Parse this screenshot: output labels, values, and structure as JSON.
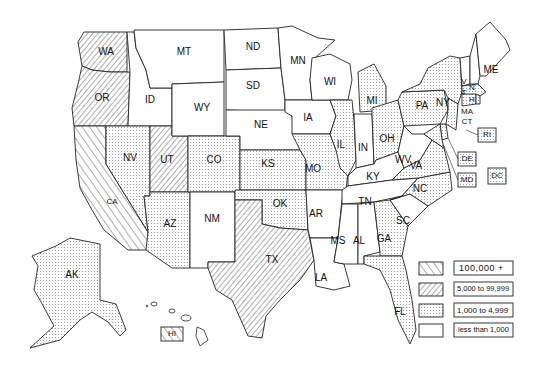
{
  "title": "",
  "legend": {
    "items": [
      {
        "key": "A",
        "label": "100,000 +",
        "pattern": "backslash-hatch"
      },
      {
        "key": "B",
        "label": "5,000 to 99,999",
        "pattern": "slash-hatch"
      },
      {
        "key": "C",
        "label": "1,000 to 4,999",
        "pattern": "dots"
      },
      {
        "key": "D",
        "label": "less than 1,000",
        "pattern": "blank"
      }
    ]
  },
  "states": {
    "WA": "B",
    "OR": "B",
    "CA": "A",
    "ID": "D",
    "NV": "C",
    "UT": "B",
    "AZ": "C",
    "MT": "D",
    "WY": "D",
    "CO": "C",
    "NM": "D",
    "ND": "D",
    "SD": "D",
    "NE": "D",
    "KS": "C",
    "OK": "C",
    "TX": "B",
    "MN": "D",
    "IA": "D",
    "MO": "C",
    "AR": "D",
    "LA": "D",
    "WI": "D",
    "IL": "C",
    "MI": "C",
    "IN": "D",
    "OH": "C",
    "KY": "D",
    "TN": "D",
    "MS": "D",
    "AL": "D",
    "GA": "C",
    "FL": "C",
    "SC": "D",
    "NC": "C",
    "VA": "C",
    "WV": "D",
    "PA": "C",
    "NY": "C",
    "NJ": "C",
    "VT": "D",
    "NH": "D",
    "ME": "D",
    "MA": "C",
    "CT": "C",
    "RI": "C",
    "DE": "C",
    "MD": "C",
    "DC": "C",
    "AK": "C",
    "HI": "A"
  },
  "labels": {
    "WA": "WA",
    "OR": "OR",
    "CA": "CA",
    "ID": "ID",
    "NV": "NV",
    "UT": "UT",
    "AZ": "AZ",
    "MT": "MT",
    "WY": "WY",
    "CO": "CO",
    "NM": "NM",
    "ND": "ND",
    "SD": "SD",
    "NE": "NE",
    "KS": "KS",
    "OK": "OK",
    "TX": "TX",
    "MN": "MN",
    "IA": "IA",
    "MO": "MO",
    "AR": "AR",
    "LA": "LA",
    "WI": "WI",
    "IL": "IL",
    "MI": "MI",
    "IN": "IN",
    "OH": "OH",
    "KY": "KY",
    "TN": "TN",
    "MS": "MS",
    "AL": "AL",
    "GA": "GA",
    "FL": "FL",
    "SC": "SC",
    "NC": "NC",
    "VA": "VA",
    "WV": "WV",
    "PA": "PA",
    "NY": "NY",
    "VT1": "V",
    "VT2": "T",
    "NH1": "N",
    "NH2": "H",
    "ME": "ME",
    "MA": "MA",
    "CT": "CT",
    "RI": "RI",
    "DE": "DE",
    "MD": "MD",
    "DC": "DC",
    "AK": "AK",
    "HI": "HI"
  }
}
